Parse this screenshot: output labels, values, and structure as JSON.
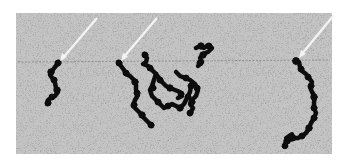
{
  "image": {
    "kind": "grayscale electron micrograph",
    "description": "Speckled gray field with three dark beaded filament chains, each marked by a white diagonal arrow",
    "colors": {
      "background": "#ffffff",
      "field": "#bdbdbd",
      "chain": "#0d0d0d",
      "arrow": "#f4f4f4"
    },
    "field_bounds": {
      "x": 16,
      "y": 13,
      "width": 316,
      "height": 141
    },
    "objects": [
      {
        "name": "left-chain",
        "arrow_tip": [
          60,
          60
        ]
      },
      {
        "name": "center-cluster",
        "arrow_tip": [
          121,
          60
        ]
      },
      {
        "name": "right-chain",
        "arrow_tip": [
          299,
          58
        ]
      }
    ]
  }
}
